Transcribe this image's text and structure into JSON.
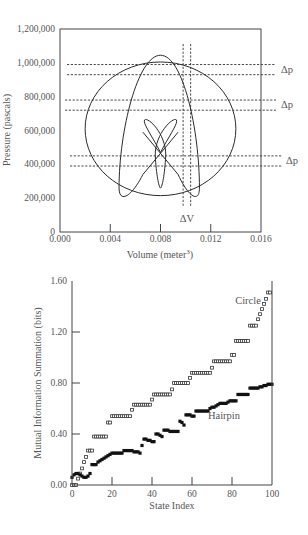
{
  "chart_data": [
    {
      "type": "line",
      "title": "",
      "xlabel": "Volume (meter^3)",
      "xlabel_main": "Volume (meter",
      "xlabel_sup": "3",
      "xlabel_close": ")",
      "ylabel": "Pressure (pascals)",
      "xlim": [
        0.0,
        0.016
      ],
      "ylim": [
        0,
        1200000
      ],
      "xticks": [
        "0.000",
        "0.004",
        "0.008",
        "0.012",
        "0.016"
      ],
      "xtick_values": [
        0.0,
        0.004,
        0.008,
        0.012,
        0.016
      ],
      "yticks": [
        "0",
        "200,000",
        "400,000",
        "600,000",
        "800,000",
        "1,000,000",
        "1,200,000"
      ],
      "ytick_values": [
        0,
        200000,
        400000,
        600000,
        800000,
        1000000,
        1200000
      ],
      "grid": false,
      "curves": [
        {
          "name": "circle",
          "description": "Large ellipse centered near (0.008, 610000)",
          "cx": 0.008,
          "cy": 610000,
          "rx": 0.006,
          "ry": 395000
        },
        {
          "name": "hairpin",
          "description": "Tall narrow loop reaching ~1,040,000 at V≈0.008, with bottom lobes near 200,000 at V≈0.005 and V≈0.011"
        },
        {
          "name": "figure-eight",
          "description": "Small crossed figure-eight/trefoil near center, V 0.0067–0.0094, P 260,000–660,000"
        }
      ],
      "annotations": [
        {
          "text": "Δp",
          "y_pair": [
            990000,
            930000
          ]
        },
        {
          "text": "Δp",
          "y_pair": [
            780000,
            720000
          ]
        },
        {
          "text": "Δp",
          "y_pair": [
            450000,
            390000
          ]
        },
        {
          "text": "ΔV",
          "x_pair": [
            0.0098,
            0.0104
          ]
        }
      ]
    },
    {
      "type": "scatter",
      "title": "",
      "xlabel": "State Index",
      "ylabel": "Mutual Information Summation (bits)",
      "xlim": [
        0,
        100
      ],
      "ylim": [
        0.0,
        1.6
      ],
      "xticks": [
        "0",
        "20",
        "40",
        "60",
        "80",
        "100"
      ],
      "xtick_values": [
        0,
        20,
        40,
        60,
        80,
        100
      ],
      "yticks": [
        "0.00",
        "0.40",
        "0.80",
        "1.20",
        "1.60"
      ],
      "ytick_values": [
        0.0,
        0.4,
        0.8,
        1.2,
        1.6
      ],
      "grid": false,
      "legend": "inline labels",
      "series": [
        {
          "name": "Circle",
          "marker": "open-square",
          "label_pos": [
            88,
            1.42
          ],
          "x": [
            0,
            1,
            2,
            3,
            4,
            5,
            6,
            7,
            8,
            9,
            10,
            11,
            12,
            13,
            14,
            15,
            16,
            17,
            18,
            19,
            20,
            21,
            22,
            23,
            24,
            25,
            26,
            27,
            28,
            29,
            30,
            31,
            32,
            33,
            34,
            35,
            36,
            37,
            38,
            39,
            40,
            41,
            42,
            43,
            44,
            45,
            46,
            47,
            48,
            49,
            50,
            51,
            52,
            53,
            54,
            55,
            56,
            57,
            58,
            59,
            60,
            61,
            62,
            63,
            64,
            65,
            66,
            67,
            68,
            69,
            70,
            71,
            72,
            73,
            74,
            75,
            76,
            77,
            78,
            79,
            80,
            81,
            82,
            83,
            84,
            85,
            86,
            87,
            88,
            89,
            90,
            91,
            92,
            93,
            94,
            95,
            96,
            97,
            98,
            99
          ],
          "values": [
            0.0,
            0.0,
            0.0,
            0.05,
            0.09,
            0.13,
            0.18,
            0.22,
            0.27,
            0.27,
            0.27,
            0.38,
            0.38,
            0.38,
            0.38,
            0.38,
            0.38,
            0.38,
            0.49,
            0.49,
            0.54,
            0.54,
            0.54,
            0.54,
            0.54,
            0.54,
            0.54,
            0.54,
            0.54,
            0.54,
            0.59,
            0.63,
            0.63,
            0.63,
            0.63,
            0.63,
            0.63,
            0.63,
            0.63,
            0.63,
            0.67,
            0.71,
            0.71,
            0.71,
            0.71,
            0.71,
            0.71,
            0.71,
            0.71,
            0.71,
            0.75,
            0.8,
            0.8,
            0.8,
            0.8,
            0.8,
            0.8,
            0.8,
            0.8,
            0.84,
            0.88,
            0.88,
            0.88,
            0.88,
            0.88,
            0.88,
            0.88,
            0.88,
            0.88,
            0.88,
            0.92,
            0.97,
            0.97,
            0.97,
            0.97,
            0.97,
            0.97,
            0.97,
            0.97,
            0.97,
            1.02,
            1.02,
            1.13,
            1.13,
            1.13,
            1.13,
            1.13,
            1.13,
            1.13,
            1.25,
            1.25,
            1.25,
            1.25,
            1.3,
            1.34,
            1.38,
            1.42,
            1.46,
            1.51,
            1.51
          ]
        },
        {
          "name": "Hairpin",
          "marker": "filled-square",
          "label_pos": [
            76,
            0.52
          ],
          "x": [
            0,
            1,
            2,
            3,
            4,
            5,
            6,
            7,
            8,
            9,
            10,
            11,
            12,
            13,
            14,
            15,
            16,
            17,
            18,
            19,
            20,
            21,
            22,
            23,
            24,
            25,
            26,
            27,
            28,
            29,
            30,
            31,
            32,
            33,
            34,
            35,
            36,
            37,
            38,
            39,
            40,
            41,
            42,
            43,
            44,
            45,
            46,
            47,
            48,
            49,
            50,
            51,
            52,
            53,
            54,
            55,
            56,
            57,
            58,
            59,
            60,
            61,
            62,
            63,
            64,
            65,
            66,
            67,
            68,
            69,
            70,
            71,
            72,
            73,
            74,
            75,
            76,
            77,
            78,
            79,
            80,
            81,
            82,
            83,
            84,
            85,
            86,
            87,
            88,
            89,
            90,
            91,
            92,
            93,
            94,
            95,
            96,
            97,
            98,
            99,
            100
          ],
          "values": [
            0.06,
            0.08,
            0.09,
            0.09,
            0.08,
            0.07,
            0.06,
            0.06,
            0.07,
            0.09,
            0.16,
            0.16,
            0.16,
            0.18,
            0.19,
            0.2,
            0.21,
            0.22,
            0.23,
            0.24,
            0.25,
            0.25,
            0.25,
            0.25,
            0.25,
            0.25,
            0.27,
            0.27,
            0.27,
            0.27,
            0.27,
            0.26,
            0.26,
            0.26,
            0.25,
            0.31,
            0.36,
            0.36,
            0.35,
            0.35,
            0.34,
            0.34,
            0.4,
            0.4,
            0.39,
            0.38,
            0.43,
            0.43,
            0.43,
            0.42,
            0.42,
            0.42,
            0.42,
            0.42,
            0.5,
            0.49,
            0.47,
            0.55,
            0.55,
            0.55,
            0.54,
            0.54,
            0.58,
            0.58,
            0.58,
            0.58,
            0.58,
            0.58,
            0.58,
            0.6,
            0.61,
            0.61,
            0.62,
            0.63,
            0.64,
            0.64,
            0.64,
            0.64,
            0.65,
            0.66,
            0.66,
            0.66,
            0.66,
            0.71,
            0.71,
            0.71,
            0.71,
            0.71,
            0.71,
            0.76,
            0.76,
            0.76,
            0.76,
            0.76,
            0.77,
            0.77,
            0.78,
            0.78,
            0.79,
            0.79,
            0.79
          ]
        }
      ]
    }
  ]
}
